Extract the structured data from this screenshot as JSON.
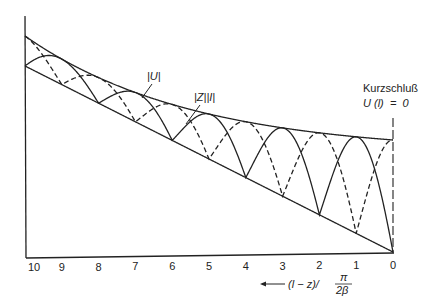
{
  "figure": {
    "kind": "standing-wave diagram on lossy transmission line",
    "colors": {
      "ink": "#222222",
      "background": "#ffffff"
    }
  },
  "labels": {
    "voltage_curve": "|U|",
    "current_curve": "|Z||I|",
    "short_circuit_title": "Kurzschluß",
    "short_circuit_condition": "U (l)  =  0",
    "x_axis_label_prefix": "(l − z)/",
    "x_axis_fraction_num": "π",
    "x_axis_fraction_den": "2β",
    "x_axis_arrow": "←"
  },
  "chart_data": {
    "type": "line",
    "title": "",
    "xlabel": "(l − z) / (π / 2β)",
    "ylabel": "",
    "x_ticks": [
      10,
      9,
      8,
      7,
      6,
      5,
      4,
      3,
      2,
      1,
      0
    ],
    "x_direction": "decreasing left to right (short circuit at right end, x = 0)",
    "xlim": [
      10,
      0
    ],
    "grid": false,
    "legend": "inline labels with pointer lines",
    "series": [
      {
        "name": "upper envelope",
        "style": "solid",
        "shape": "exponentially decaying toward right, relative 1.0 at x=10 to ~0.57 at x=0"
      },
      {
        "name": "lower envelope",
        "style": "solid",
        "shape": "nearly linear decay, relative ~0.88 at x=10 to 0 at x=0"
      },
      {
        "name": "|U|",
        "style": "solid",
        "note": "touches upper envelope at odd ticks, lower envelope at even ticks; 0 at x=0"
      },
      {
        "name": "|Z||I|",
        "style": "dashed",
        "note": "touches upper envelope at even ticks, lower envelope at odd ticks; maximum at x=0"
      }
    ],
    "annotations": [
      "Kurzschluß",
      "U (l) = 0"
    ]
  }
}
